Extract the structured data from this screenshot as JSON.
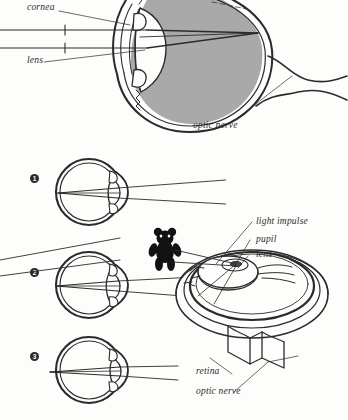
{
  "figure": {
    "kind": "anatomical-diagram",
    "background_color": "#fdfdfb",
    "ink_color": "#2b2b2b",
    "vitreous_fill_color": "#a9a9a9",
    "panels": [
      {
        "id": "cross-section",
        "description": "Large sagittal cross-section of the eye with incoming parallel light rays from the left, grey vitreous body, and optic nerve leaving to the lower right.",
        "labels": [
          {
            "name": "cornea",
            "text": "cornea",
            "x": 27,
            "y": 7
          },
          {
            "name": "lens",
            "text": "lens",
            "x": 27,
            "y": 60
          },
          {
            "name": "optic-nerve",
            "text": "optic nerve",
            "x": 193,
            "y": 124
          }
        ]
      },
      {
        "id": "accommodation-sequence",
        "description": "Three small schematic eyes showing accommodation of the lens for light arriving at different angles.",
        "steps": [
          {
            "marker": "1",
            "x": 30,
            "y": 174
          },
          {
            "marker": "2",
            "x": 30,
            "y": 268
          },
          {
            "marker": "3",
            "x": 30,
            "y": 352
          }
        ]
      },
      {
        "id": "three-dimensional-eye",
        "description": "Cutaway three-quarter view of the eyeball showing the lens, pupil and retina, with the optic nerve stub below, and a black teddy bear as the viewed object sending a light impulse into the eye.",
        "object": {
          "name": "teddy-bear",
          "description": "black teddy bear silhouette"
        },
        "labels": [
          {
            "name": "light-impulse",
            "text": "light impulse",
            "x": 256,
            "y": 216
          },
          {
            "name": "pupil",
            "text": "pupil",
            "x": 256,
            "y": 234
          },
          {
            "name": "lens",
            "text": "lens",
            "x": 256,
            "y": 249
          },
          {
            "name": "retina",
            "text": "retina",
            "x": 196,
            "y": 366
          },
          {
            "name": "optic-nerve",
            "text": "optic nerve",
            "x": 196,
            "y": 386
          }
        ]
      }
    ]
  }
}
